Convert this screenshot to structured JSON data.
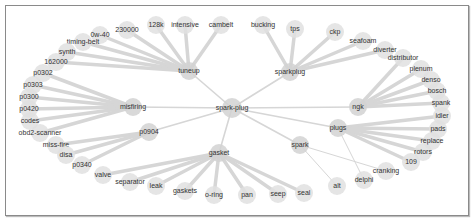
{
  "graph": {
    "center": "spark-plug",
    "nodes": [
      {
        "id": "spark-plug",
        "hub": true
      },
      {
        "id": "tuneup",
        "hub": true
      },
      {
        "id": "sparkplug",
        "hub": true
      },
      {
        "id": "misfiring",
        "hub": true
      },
      {
        "id": "p0904",
        "hub": true
      },
      {
        "id": "ngk",
        "hub": true
      },
      {
        "id": "plugs",
        "hub": true
      },
      {
        "id": "gasket",
        "hub": true
      },
      {
        "id": "spark",
        "hub": true
      },
      {
        "id": "0w-40"
      },
      {
        "id": "230000"
      },
      {
        "id": "128k"
      },
      {
        "id": "intensive"
      },
      {
        "id": "cambelt"
      },
      {
        "id": "timing-belt"
      },
      {
        "id": "synth"
      },
      {
        "id": "162000"
      },
      {
        "id": "bucking"
      },
      {
        "id": "tps"
      },
      {
        "id": "ckp"
      },
      {
        "id": "seafoam"
      },
      {
        "id": "diverter"
      },
      {
        "id": "distributor"
      },
      {
        "id": "plenum"
      },
      {
        "id": "denso"
      },
      {
        "id": "bosch"
      },
      {
        "id": "spank"
      },
      {
        "id": "idler"
      },
      {
        "id": "pads"
      },
      {
        "id": "replace"
      },
      {
        "id": "rotors"
      },
      {
        "id": "109"
      },
      {
        "id": "cranking"
      },
      {
        "id": "delphi"
      },
      {
        "id": "alt"
      },
      {
        "id": "p0302"
      },
      {
        "id": "p0303"
      },
      {
        "id": "p0300"
      },
      {
        "id": "p0420"
      },
      {
        "id": "codes"
      },
      {
        "id": "obd2-scanner"
      },
      {
        "id": "miss-fire"
      },
      {
        "id": "disa"
      },
      {
        "id": "p0340"
      },
      {
        "id": "valve"
      },
      {
        "id": "separator"
      },
      {
        "id": "leak"
      },
      {
        "id": "gaskets"
      },
      {
        "id": "o-ring"
      },
      {
        "id": "pan"
      },
      {
        "id": "seep"
      },
      {
        "id": "seal"
      }
    ],
    "edges": [
      [
        "spark-plug",
        "tuneup"
      ],
      [
        "spark-plug",
        "sparkplug"
      ],
      [
        "spark-plug",
        "misfiring"
      ],
      [
        "spark-plug",
        "p0904"
      ],
      [
        "spark-plug",
        "ngk"
      ],
      [
        "spark-plug",
        "plugs"
      ],
      [
        "spark-plug",
        "gasket"
      ],
      [
        "spark-plug",
        "spark"
      ],
      [
        "tuneup",
        "0w-40"
      ],
      [
        "tuneup",
        "230000"
      ],
      [
        "tuneup",
        "128k"
      ],
      [
        "tuneup",
        "intensive"
      ],
      [
        "tuneup",
        "cambelt"
      ],
      [
        "tuneup",
        "timing-belt"
      ],
      [
        "tuneup",
        "synth"
      ],
      [
        "tuneup",
        "162000"
      ],
      [
        "sparkplug",
        "bucking"
      ],
      [
        "sparkplug",
        "tps"
      ],
      [
        "sparkplug",
        "ckp"
      ],
      [
        "sparkplug",
        "seafoam"
      ],
      [
        "sparkplug",
        "diverter"
      ],
      [
        "ngk",
        "distributor"
      ],
      [
        "ngk",
        "plenum"
      ],
      [
        "ngk",
        "denso"
      ],
      [
        "ngk",
        "bosch"
      ],
      [
        "ngk",
        "spank"
      ],
      [
        "plugs",
        "idler"
      ],
      [
        "plugs",
        "pads"
      ],
      [
        "plugs",
        "replace"
      ],
      [
        "plugs",
        "rotors"
      ],
      [
        "plugs",
        "109"
      ],
      [
        "plugs",
        "delphi"
      ],
      [
        "spark",
        "cranking"
      ],
      [
        "spark",
        "alt"
      ],
      [
        "misfiring",
        "p0302"
      ],
      [
        "misfiring",
        "p0303"
      ],
      [
        "misfiring",
        "p0300"
      ],
      [
        "misfiring",
        "p0420"
      ],
      [
        "misfiring",
        "codes"
      ],
      [
        "misfiring",
        "obd2-scanner"
      ],
      [
        "p0904",
        "miss-fire"
      ],
      [
        "p0904",
        "disa"
      ],
      [
        "p0904",
        "p0340"
      ],
      [
        "gasket",
        "valve"
      ],
      [
        "gasket",
        "separator"
      ],
      [
        "gasket",
        "leak"
      ],
      [
        "gasket",
        "gaskets"
      ],
      [
        "gasket",
        "o-ring"
      ],
      [
        "gasket",
        "pan"
      ],
      [
        "gasket",
        "seep"
      ],
      [
        "gasket",
        "seal"
      ]
    ]
  }
}
